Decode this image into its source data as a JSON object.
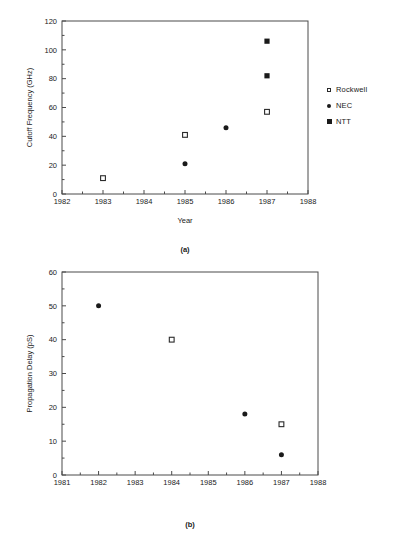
{
  "chart_data": [
    {
      "type": "scatter",
      "panel": "(a)",
      "title": "",
      "xlabel": "Year",
      "ylabel": "Cutoff Frequency (GHz)",
      "xlim": [
        1982,
        1988
      ],
      "ylim": [
        0,
        120
      ],
      "xticks": [
        1982,
        1983,
        1984,
        1985,
        1986,
        1987,
        1988
      ],
      "xtick_labels": [
        "1982",
        "1983",
        "1984",
        "1985",
        "1986",
        "1987",
        "1988"
      ],
      "yticks": [
        0,
        20,
        40,
        60,
        80,
        100,
        120
      ],
      "ytick_labels": [
        "0",
        "20",
        "40",
        "60",
        "80",
        "100",
        "120"
      ],
      "minor_ticks": true,
      "grid": false,
      "legend_position": "right",
      "series": [
        {
          "name": "Rockwell",
          "marker": "open-square",
          "points": [
            {
              "x": 1983,
              "y": 11
            },
            {
              "x": 1985,
              "y": 41
            },
            {
              "x": 1987,
              "y": 57
            }
          ]
        },
        {
          "name": "NEC",
          "marker": "filled-circle",
          "points": [
            {
              "x": 1985,
              "y": 21
            },
            {
              "x": 1986,
              "y": 46
            }
          ]
        },
        {
          "name": "NTT",
          "marker": "filled-square",
          "points": [
            {
              "x": 1987,
              "y": 82
            },
            {
              "x": 1987,
              "y": 106
            }
          ]
        }
      ]
    },
    {
      "type": "scatter",
      "panel": "(b)",
      "title": "",
      "xlabel": "",
      "ylabel": "Propagation Delay (pS)",
      "xlim": [
        1981,
        1988
      ],
      "ylim": [
        0,
        60
      ],
      "xticks": [
        1981,
        1982,
        1983,
        1984,
        1985,
        1986,
        1987,
        1988
      ],
      "xtick_labels": [
        "1981",
        "1982",
        "1983",
        "1984",
        "1985",
        "1986",
        "1987",
        "1988"
      ],
      "yticks": [
        0,
        10,
        20,
        30,
        40,
        50,
        60
      ],
      "ytick_labels": [
        "0",
        "10",
        "20",
        "30",
        "40",
        "50",
        "60"
      ],
      "minor_ticks": true,
      "grid": false,
      "legend_position": "right",
      "series": [
        {
          "name": "Rockwell",
          "marker": "open-square",
          "points": [
            {
              "x": 1984,
              "y": 40
            },
            {
              "x": 1987,
              "y": 15
            }
          ]
        },
        {
          "name": "NTT",
          "marker": "filled-circle",
          "points": [
            {
              "x": 1982,
              "y": 50
            },
            {
              "x": 1986,
              "y": 18
            },
            {
              "x": 1987,
              "y": 6
            }
          ]
        }
      ]
    }
  ],
  "figure_a": {
    "caption": "(a)",
    "ylabel": "Cutoff Frequency (GHz)",
    "xlabel": "Year",
    "legend": [
      {
        "label": "Rockwell",
        "marker": "open-square"
      },
      {
        "label": "NEC",
        "marker": "filled-circle"
      },
      {
        "label": "NTT",
        "marker": "filled-square"
      }
    ]
  },
  "figure_b": {
    "caption": "(b)",
    "ylabel": "Propagation Delay (pS)",
    "xlabel": "",
    "legend": [
      {
        "label": "Rockwell",
        "marker": "open-square"
      },
      {
        "label": "NTT",
        "marker": "filled-circle"
      }
    ]
  }
}
